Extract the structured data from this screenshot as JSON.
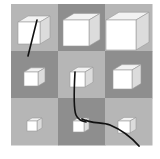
{
  "puzzle": {
    "grid": {
      "rows": 3,
      "cols": 3,
      "origin": [
        11,
        4
      ],
      "cell_size": 47,
      "colors": {
        "light": "#b6b6b6",
        "dark": "#8e8e8e"
      },
      "cells": [
        {
          "row": 0,
          "col": 0,
          "bg": "light",
          "cube": {
            "x": 18,
            "y": 22,
            "size": 22,
            "depth": 10
          }
        },
        {
          "row": 0,
          "col": 1,
          "bg": "dark",
          "cube": {
            "x": 63,
            "y": 20,
            "size": 26,
            "depth": 11
          }
        },
        {
          "row": 0,
          "col": 2,
          "bg": "light",
          "cube": {
            "x": 106,
            "y": 20,
            "size": 30,
            "depth": 13
          }
        },
        {
          "row": 1,
          "col": 0,
          "bg": "dark",
          "cube": {
            "x": 24,
            "y": 72,
            "size": 14,
            "depth": 7
          }
        },
        {
          "row": 1,
          "col": 1,
          "bg": "light",
          "cube": {
            "x": 70,
            "y": 72,
            "size": 15,
            "depth": 8
          }
        },
        {
          "row": 1,
          "col": 2,
          "bg": "dark",
          "cube": {
            "x": 113,
            "y": 70,
            "size": 19,
            "depth": 9
          }
        },
        {
          "row": 2,
          "col": 0,
          "bg": "light",
          "cube": {
            "x": 27,
            "y": 121,
            "size": 10,
            "depth": 5
          }
        },
        {
          "row": 2,
          "col": 1,
          "bg": "dark",
          "cube": {
            "x": 73,
            "y": 121,
            "size": 11,
            "depth": 5
          }
        },
        {
          "row": 2,
          "col": 2,
          "bg": "light",
          "cube": {
            "x": 118,
            "y": 121,
            "size": 12,
            "depth": 6
          }
        }
      ]
    },
    "strokes": [
      {
        "d": "M37 20 L28 56",
        "color": "#111111",
        "width": 1.6
      },
      {
        "d": "M75 72 C74 90 73 108 76 115 C78 120 82 121 86 122",
        "color": "#111111",
        "width": 1.6
      },
      {
        "d": "M82 119 C92 124 102 122 110 125 C122 130 132 138 139 146",
        "color": "#111111",
        "width": 1.8
      }
    ],
    "cube_colors": {
      "front": "#ffffff",
      "top": "#f2f2f2",
      "side": "#dcdcdc",
      "edge": "#9a9a9a"
    }
  }
}
